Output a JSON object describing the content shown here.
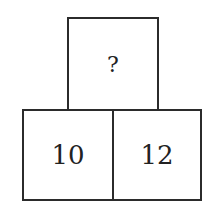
{
  "diagram": {
    "type": "number-pyramid",
    "top": {
      "value": "?"
    },
    "bottom": [
      {
        "value": "10"
      },
      {
        "value": "12"
      }
    ]
  }
}
